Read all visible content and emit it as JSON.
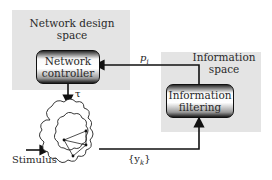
{
  "diagram": {
    "network_design_space": {
      "title_line1": "Network design",
      "title_line2": "space",
      "controller": {
        "line1": "Network",
        "line2": "controller"
      }
    },
    "information_space": {
      "title_line1": "Information",
      "title_line2": "space",
      "filter": {
        "line1": "Information",
        "line2": "filtering"
      }
    },
    "labels": {
      "p": "p",
      "p_sub": "i",
      "tau": "τ",
      "stimulus": "Stimulus",
      "y": "{y",
      "y_sub": "k",
      "y_close": "}"
    },
    "colors": {
      "panel": "#e4e4e4",
      "line": "#111111"
    }
  }
}
